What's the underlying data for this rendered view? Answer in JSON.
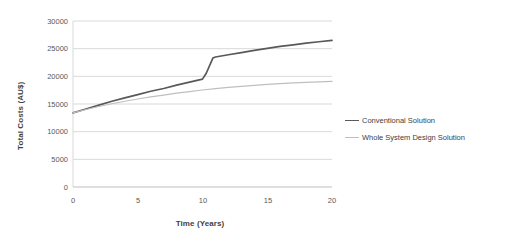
{
  "chart_data": {
    "type": "line",
    "title": "",
    "xlabel": "Time (Years)",
    "ylabel": "Total Costs (AU$)",
    "xlim": [
      0,
      20
    ],
    "ylim": [
      0,
      30000
    ],
    "xticks": [
      "0",
      "5",
      "10",
      "15",
      "20"
    ],
    "yticks": [
      "0",
      "5000",
      "10000",
      "15000",
      "20000",
      "25000",
      "30000"
    ],
    "grid": "horizontal",
    "legend_position": "right",
    "series": [
      {
        "name": "Conventional Solution",
        "color": "#595959",
        "x": [
          0,
          1,
          2,
          3,
          4,
          5,
          6,
          7,
          8,
          9,
          10,
          10.3,
          10.8,
          11,
          12,
          13,
          14,
          15,
          16,
          17,
          18,
          19,
          20
        ],
        "values": [
          13400,
          14100,
          14800,
          15500,
          16100,
          16700,
          17300,
          17800,
          18400,
          18950,
          19500,
          20600,
          23300,
          23500,
          23900,
          24300,
          24700,
          25050,
          25400,
          25700,
          26000,
          26250,
          26500
        ]
      },
      {
        "name": "Whole System Design Solution",
        "color": "#bfbfbf",
        "x": [
          0,
          1,
          2,
          3,
          4,
          5,
          6,
          7,
          8,
          9,
          10,
          11,
          12,
          13,
          14,
          15,
          16,
          17,
          18,
          19,
          20
        ],
        "values": [
          13400,
          14000,
          14550,
          15050,
          15500,
          15900,
          16280,
          16620,
          16950,
          17250,
          17530,
          17780,
          18000,
          18200,
          18380,
          18550,
          18700,
          18820,
          18920,
          19000,
          19080
        ]
      }
    ]
  },
  "legend": {
    "items": [
      {
        "label": "Conventional Solution"
      },
      {
        "label": "Whole System Design Solution"
      }
    ]
  }
}
